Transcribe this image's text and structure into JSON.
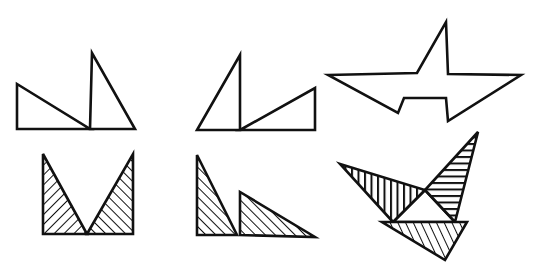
{
  "figure": {
    "stroke_color": "#111111",
    "background": "#ffffff",
    "hatch_patterns": {
      "diag_down": "hatch lines descending left-to-right",
      "diag_up": "hatch lines ascending left-to-right",
      "vertical": "vertical hatch lines",
      "horizontal": "horizontal hatch lines"
    },
    "shapes": [
      {
        "id": "top-left",
        "label": "two outline right triangles, left low wide, right tall"
      },
      {
        "id": "top-middle",
        "label": "two outline right triangles, left tall, right low wide"
      },
      {
        "id": "top-right",
        "label": "outline star-like polygon"
      },
      {
        "id": "bottom-left",
        "label": "two hatched triangles forming a V"
      },
      {
        "id": "bottom-middle",
        "label": "two hatched right triangles side by side"
      },
      {
        "id": "bottom-right",
        "label": "three hatched triangles surrounding a white triangle"
      }
    ]
  }
}
